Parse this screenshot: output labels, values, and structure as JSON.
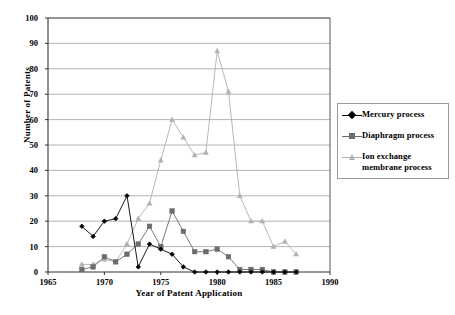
{
  "chart_data": {
    "type": "line",
    "title": "",
    "xlabel": "Year of Patent Application",
    "ylabel": "Number of Patents",
    "xlim": [
      1965,
      1990
    ],
    "ylim": [
      0,
      100
    ],
    "xticks": [
      1965,
      1970,
      1975,
      1980,
      1985,
      1990
    ],
    "yticks": [
      0,
      10,
      20,
      30,
      40,
      50,
      60,
      70,
      80,
      90,
      100
    ],
    "grid": "horizontal",
    "legend_position": "right",
    "series": [
      {
        "name": "Mercury process",
        "color": "#000000",
        "marker": "diamond",
        "x": [
          1968,
          1969,
          1970,
          1971,
          1972,
          1973,
          1974,
          1975,
          1976,
          1977,
          1978,
          1979,
          1980,
          1981,
          1982,
          1983,
          1984,
          1985,
          1986,
          1987
        ],
        "values": [
          18,
          14,
          20,
          21,
          30,
          2,
          11,
          9,
          7,
          2,
          0,
          0,
          0,
          0,
          0,
          0,
          0,
          0,
          0,
          0
        ]
      },
      {
        "name": "Diaphragm process",
        "color": "#6b6b6b",
        "marker": "square",
        "x": [
          1968,
          1969,
          1970,
          1971,
          1972,
          1973,
          1974,
          1975,
          1976,
          1977,
          1978,
          1979,
          1980,
          1981,
          1982,
          1983,
          1984,
          1985,
          1986,
          1987
        ],
        "values": [
          1,
          2,
          6,
          4,
          7,
          11,
          18,
          10,
          24,
          16,
          8,
          8,
          9,
          6,
          1,
          1,
          1,
          0,
          0,
          0
        ]
      },
      {
        "name": "Ion exchange membrane process",
        "color": "#b0b0b0",
        "marker": "triangle",
        "x": [
          1968,
          1969,
          1970,
          1971,
          1972,
          1973,
          1974,
          1975,
          1976,
          1977,
          1978,
          1979,
          1980,
          1981,
          1982,
          1983,
          1984,
          1985,
          1986,
          1987
        ],
        "values": [
          3,
          3,
          5,
          4,
          11,
          21,
          27,
          44,
          60,
          53,
          46,
          47,
          87,
          71,
          30,
          20,
          20,
          10,
          12,
          7
        ]
      }
    ]
  },
  "legend": {
    "items": [
      {
        "label": "Mercury process"
      },
      {
        "label": "Diaphragm process"
      },
      {
        "label": "Ion exchange\nmembrane process"
      }
    ]
  }
}
